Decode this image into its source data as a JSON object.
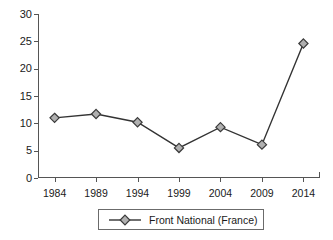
{
  "chart_data": {
    "type": "line",
    "title": "",
    "xlabel": "",
    "ylabel": "",
    "categories": [
      "1984",
      "1989",
      "1994",
      "1999",
      "2004",
      "2009",
      "2014"
    ],
    "x": [
      1984,
      1989,
      1994,
      1999,
      2004,
      2009,
      2014
    ],
    "series": [
      {
        "name": "Front National (France)",
        "values": [
          11.0,
          11.7,
          10.2,
          5.5,
          9.3,
          6.1,
          24.6
        ],
        "marker": "diamond",
        "marker_fill": "#b0b0b0",
        "marker_edge": "#3a3a3a",
        "line_color": "#333333"
      }
    ],
    "ylim": [
      0,
      30
    ],
    "yticks": [
      0,
      5,
      10,
      15,
      20,
      25,
      30
    ],
    "ytick_labels": [
      "0",
      "5",
      "10",
      "15",
      "20",
      "25",
      "30"
    ],
    "xlim": [
      1982,
      2016
    ],
    "grid": false,
    "legend_position": "bottom-center",
    "legend_entries": [
      "Front National (France)"
    ],
    "background": "#ffffff",
    "axis_color": "#555555"
  },
  "legend": {
    "items": [
      {
        "label": "Front National (France)",
        "marker_icon": "diamond-marker-icon"
      }
    ]
  },
  "axes": {
    "y_axis_name": "value-axis",
    "x_axis_name": "year-axis"
  }
}
